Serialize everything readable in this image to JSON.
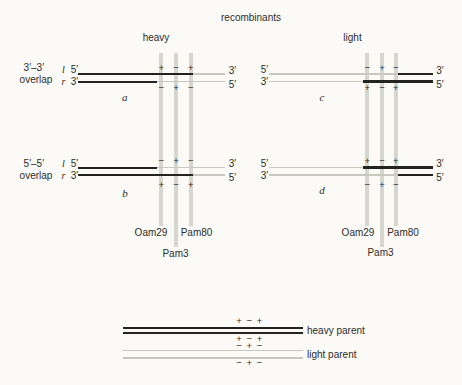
{
  "title": "recombinants",
  "columns": {
    "left": "heavy",
    "right": "light"
  },
  "overlap": {
    "o33": "3′–3′",
    "o55": "5′–5′",
    "word": "overlap"
  },
  "strands": {
    "l": "l",
    "r": "r"
  },
  "ends": {
    "five": "5′",
    "three": "3′"
  },
  "markers": {
    "oam29": "Oam29",
    "pam3": "Pam3",
    "pam80": "Pam80"
  },
  "panels": {
    "a": {
      "letter": "a",
      "above": [
        "+",
        "−",
        "+"
      ],
      "below": [
        "−",
        "+",
        "−"
      ]
    },
    "b": {
      "letter": "b",
      "above": [
        "−",
        "+",
        "−"
      ],
      "below": [
        "+",
        "−",
        "+"
      ]
    },
    "c": {
      "letter": "c",
      "above": [
        "−",
        "+",
        "−"
      ],
      "below": [
        "+",
        "−",
        "+"
      ]
    },
    "d": {
      "letter": "d",
      "above": [
        "+",
        "−",
        "+"
      ],
      "below": [
        "−",
        "+",
        "−"
      ]
    }
  },
  "legend": {
    "heavy_label": "heavy parent",
    "light_label": "light parent",
    "heavy_signs_top": "+ − +",
    "heavy_signs_bottom": "+ − +",
    "light_signs_top": "− + −",
    "light_signs_bottom": "− + −"
  },
  "colors": {
    "heavy_strand": "#232321",
    "light_strand": "#c8c8c3",
    "marker_bar": "#d6d6d1",
    "background": "#fbfaf7",
    "text": "#2d2d2a"
  }
}
